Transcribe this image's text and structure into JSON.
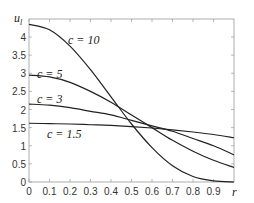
{
  "chart_data": {
    "type": "line",
    "title": "",
    "xlabel": "r",
    "ylabel": "u_l",
    "xlim": [
      0,
      1
    ],
    "ylim": [
      0,
      4.5
    ],
    "xticks": [
      "0",
      "0.1",
      "0.2",
      "0.3",
      "0.4",
      "0.5",
      "0.6",
      "0.7",
      "0.8",
      "0.9"
    ],
    "yticks": [
      "0",
      "0.5",
      "1",
      "1.5",
      "2",
      "2.5",
      "3",
      "3.5",
      "4"
    ],
    "grid": false,
    "x": [
      0,
      0.1,
      0.2,
      0.3,
      0.4,
      0.5,
      0.6,
      0.7,
      0.8,
      0.9,
      1.0
    ],
    "series": [
      {
        "name": "c = 10",
        "values": [
          4.35,
          4.2,
          3.75,
          3.1,
          2.35,
          1.6,
          0.95,
          0.45,
          0.15,
          0.03,
          0.0
        ]
      },
      {
        "name": "c = 5",
        "values": [
          2.95,
          2.9,
          2.75,
          2.5,
          2.2,
          1.85,
          1.5,
          1.15,
          0.85,
          0.6,
          0.4
        ]
      },
      {
        "name": "c = 3",
        "values": [
          2.15,
          2.12,
          2.05,
          1.95,
          1.85,
          1.7,
          1.55,
          1.4,
          1.2,
          1.0,
          0.75
        ]
      },
      {
        "name": "c = 1.5",
        "values": [
          1.62,
          1.61,
          1.6,
          1.58,
          1.56,
          1.53,
          1.49,
          1.44,
          1.38,
          1.31,
          1.22
        ]
      }
    ]
  },
  "labels": {
    "ylabel": "u",
    "ylabel_sub": "l",
    "xlabel": "r",
    "c10": "c = 10",
    "c5": "c = 5",
    "c3": "c = 3",
    "c15": "c = 1.5"
  }
}
